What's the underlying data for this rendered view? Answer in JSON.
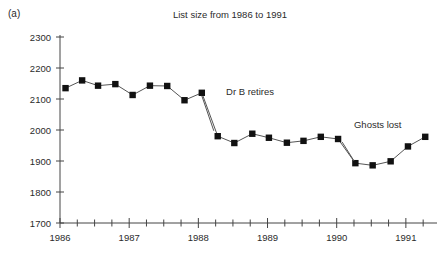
{
  "panel": {
    "label": "(a)"
  },
  "chart_data": {
    "type": "line",
    "title": "List size from 1986 to 1991",
    "xlabel": "",
    "ylabel": "",
    "xlim": [
      1986.0,
      1991.45
    ],
    "ylim": [
      1700,
      2300
    ],
    "ytick_labels": [
      "1700",
      "1800",
      "1900",
      "2000",
      "2100",
      "2200",
      "2300"
    ],
    "yticks": [
      1700,
      1800,
      1900,
      2000,
      2100,
      2200,
      2300
    ],
    "xtick_labels": [
      "1986",
      "1987",
      "1988",
      "1989",
      "1990",
      "1991"
    ],
    "xticks": [
      1986,
      1987,
      1988,
      1989,
      1990,
      1991
    ],
    "minor_xtick_interval": 0.25,
    "grid": false,
    "legend": null,
    "marker": "filled-square",
    "line_color": "#555555",
    "marker_color": "#111111",
    "x": [
      1986.08,
      1986.32,
      1986.55,
      1986.8,
      1987.05,
      1987.3,
      1987.55,
      1987.8,
      1988.05,
      1988.28,
      1988.52,
      1988.78,
      1989.02,
      1989.28,
      1989.52,
      1989.77,
      1990.02,
      1990.27,
      1990.52,
      1990.78,
      1991.03,
      1991.28
    ],
    "values": [
      2135,
      2160,
      2143,
      2148,
      2113,
      2143,
      2142,
      2096,
      2120,
      1980,
      1958,
      1988,
      1975,
      1959,
      1965,
      1978,
      1971,
      1893,
      1886,
      1899,
      1947,
      1978
    ],
    "annotations": [
      {
        "text": "Dr B retires",
        "x": 1988.05,
        "y": 2120,
        "text_x": 1988.4,
        "text_y": 2125
      },
      {
        "text": "Ghosts lost",
        "x": 1990.02,
        "y": 1971,
        "text_x": 1990.25,
        "text_y": 2005
      }
    ]
  }
}
